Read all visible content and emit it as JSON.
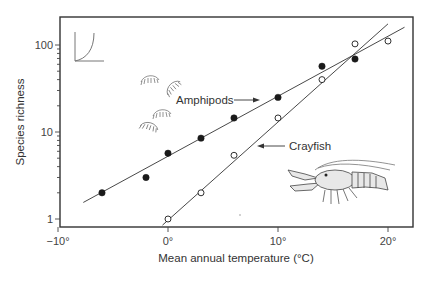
{
  "chart_data": {
    "type": "scatter",
    "title": "",
    "xlabel": "Mean annual temperature (°C)",
    "ylabel": "Species richness",
    "xscale": "linear",
    "yscale": "log",
    "xlim": [
      -10,
      22
    ],
    "ylim": [
      0.8,
      180
    ],
    "x_ticks": [
      -10,
      0,
      10,
      20
    ],
    "x_tick_labels": [
      "−10°",
      "0°",
      "10°",
      "20°"
    ],
    "y_ticks": [
      1,
      10,
      100
    ],
    "y_tick_labels": [
      "1",
      "10",
      "100"
    ],
    "grid": false,
    "legend": "none (inline annotations with arrows)",
    "series": [
      {
        "name": "Amphipods",
        "marker": "filled circle",
        "points": [
          {
            "x": -6,
            "y": 2
          },
          {
            "x": -2,
            "y": 3
          },
          {
            "x": 0,
            "y": 5.7
          },
          {
            "x": 3,
            "y": 8.5
          },
          {
            "x": 6,
            "y": 14.5
          },
          {
            "x": 10,
            "y": 25
          },
          {
            "x": 14,
            "y": 57
          },
          {
            "x": 17,
            "y": 69
          }
        ],
        "fit_line": {
          "x_start": -7.7,
          "y_start": 1.55,
          "x_end": 21.5,
          "y_end": 160
        }
      },
      {
        "name": "Crayfish",
        "marker": "open circle",
        "points": [
          {
            "x": 0,
            "y": 1
          },
          {
            "x": 3,
            "y": 2
          },
          {
            "x": 6,
            "y": 5.4
          },
          {
            "x": 10,
            "y": 14.5
          },
          {
            "x": 14,
            "y": 40
          },
          {
            "x": 17,
            "y": 103
          },
          {
            "x": 20,
            "y": 111
          }
        ],
        "fit_line": {
          "x_start": -0.5,
          "y_start": 0.85,
          "x_end": 20,
          "y_end": 175
        }
      }
    ],
    "annotations": [
      {
        "text": "Amphipods",
        "arrow_to": "Amphipods line"
      },
      {
        "text": "Crayfish",
        "arrow_to": "Crayfish line"
      }
    ],
    "inset": "small exponential-curve sketch in upper-left corner",
    "illustrations": [
      "amphipod drawings (4)",
      "crayfish drawing"
    ]
  },
  "labels": {
    "xlabel": "Mean annual temperature (°C)",
    "ylabel": "Species richness",
    "amphipods": "Amphipods",
    "crayfish": "Crayfish",
    "xt0": "−10°",
    "xt1": "0°",
    "xt2": "10°",
    "xt3": "20°",
    "yt0": "1",
    "yt1": "10",
    "yt2": "100"
  },
  "colors": {
    "ink": "#222222",
    "axis": "#333333",
    "background": "#ffffff"
  }
}
